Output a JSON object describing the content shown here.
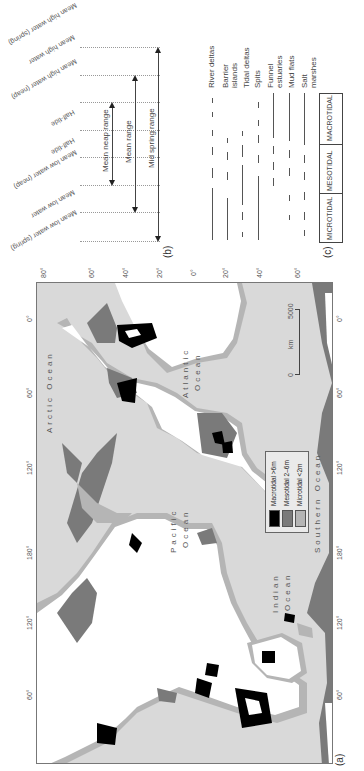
{
  "panels": {
    "a": "(a)",
    "b": "(b)",
    "c": "(c)"
  },
  "panel_b": {
    "levels": [
      {
        "label": "Mean high water",
        "sub": "(spring)",
        "y": 47
      },
      {
        "label": "Mean high water",
        "sub": "",
        "y": 75
      },
      {
        "label": "Mean high water",
        "sub": "(neap)",
        "y": 102
      },
      {
        "label": "Half-tide",
        "sub": "",
        "y": 130
      },
      {
        "label": "Half-tide",
        "sub": "",
        "y": 157
      },
      {
        "label": "Mean low water",
        "sub": "(neap)",
        "y": 185
      },
      {
        "label": "Mean low water",
        "sub": "",
        "y": 212
      },
      {
        "label": "Mean low water",
        "sub": "(spring)",
        "y": 241
      }
    ],
    "ranges": [
      {
        "label": "Mean neap range",
        "from": "Mean high water (neap)",
        "to": "Mean low water (neap)"
      },
      {
        "label": "Mean range",
        "from": "Mean high water",
        "to": "Mean low water"
      },
      {
        "label": "Mid spring range",
        "from": "Mean high water (spring)",
        "to": "Mean low water (spring)"
      }
    ]
  },
  "panel_c": {
    "landforms": [
      {
        "label": "River deltas",
        "line2": ""
      },
      {
        "label": "Barrier",
        "line2": "islands"
      },
      {
        "label": "Tidal deltas",
        "line2": ""
      },
      {
        "label": "Spits",
        "line2": ""
      },
      {
        "label": "Funnel",
        "line2": "estuaries"
      },
      {
        "label": "Mud flats",
        "line2": ""
      },
      {
        "label": "Salt",
        "line2": "marshes"
      }
    ],
    "regimes": [
      "MACROTIDAL",
      "MESOTIDAL",
      "MICROTIDAL"
    ]
  },
  "panel_a": {
    "latitude_ticks": [
      "80°",
      "60°",
      "40°",
      "20°",
      "0°",
      "20°",
      "40°",
      "60°"
    ],
    "longitude_ticks": [
      "0°",
      "60°",
      "120°",
      "180°",
      "120°",
      "60°"
    ],
    "oceans": {
      "arctic": "Arctic Ocean",
      "atlantic_1": "Atlantic",
      "atlantic_2": "Ocean",
      "pacific_1": "Pacific",
      "pacific_2": "Ocean",
      "indian_1": "Indian",
      "indian_2": "Ocean",
      "southern": "Southern Ocean"
    },
    "scale": {
      "zero": "0",
      "max": "5000",
      "unit": "km"
    },
    "legend": [
      {
        "label": "Macrotidal >6m",
        "color": "#000000"
      },
      {
        "label": "Mesotidal 2–6m",
        "color": "#7a7a7a"
      },
      {
        "label": "Microtidal <2m",
        "color": "#b5b5b5"
      }
    ],
    "colors": {
      "sea": "#d9d9d9",
      "land": "#ffffff",
      "macrotidal": "#000000",
      "mesotidal": "#7a7a7a",
      "microtidal": "#b5b5b5"
    }
  }
}
